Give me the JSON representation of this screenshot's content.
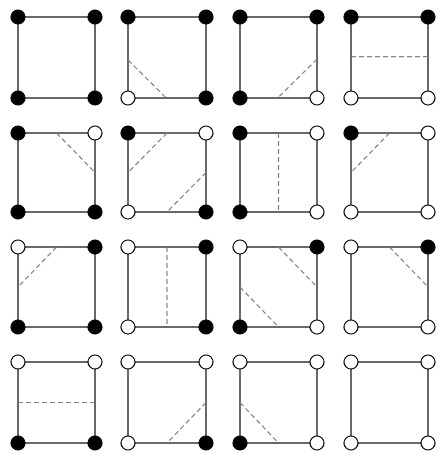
{
  "diagram": {
    "type": "marching-squares-cases",
    "colors": {
      "edge": "#2a2a2a",
      "filled": "#000000",
      "open_fill": "#ffffff",
      "dash": "#808080"
    },
    "columns_x": [
      [
        18,
        95
      ],
      [
        128,
        206
      ],
      [
        240,
        317
      ],
      [
        351,
        428
      ]
    ],
    "rows_y": [
      [
        17,
        98
      ],
      [
        133,
        212
      ],
      [
        247,
        327
      ],
      [
        362,
        443
      ]
    ],
    "vertex_radius": 7,
    "cells": [
      {
        "case": 1,
        "row": 0,
        "col": 0,
        "corners": {
          "tl": true,
          "tr": true,
          "bl": true,
          "br": true
        },
        "dashes": []
      },
      {
        "case": 2,
        "row": 0,
        "col": 1,
        "corners": {
          "tl": true,
          "tr": true,
          "bl": false,
          "br": true
        },
        "dashes": [
          [
            0,
            0.53,
            0.49,
            1
          ]
        ]
      },
      {
        "case": 3,
        "row": 0,
        "col": 2,
        "corners": {
          "tl": true,
          "tr": true,
          "bl": true,
          "br": false
        },
        "dashes": [
          [
            1,
            0.52,
            0.49,
            1
          ]
        ]
      },
      {
        "case": 4,
        "row": 0,
        "col": 3,
        "corners": {
          "tl": true,
          "tr": true,
          "bl": false,
          "br": false
        },
        "dashes": [
          [
            0,
            0.49,
            1,
            0.49
          ]
        ]
      },
      {
        "case": 5,
        "row": 1,
        "col": 0,
        "corners": {
          "tl": true,
          "tr": false,
          "bl": true,
          "br": true
        },
        "dashes": [
          [
            0.5,
            0,
            1,
            0.5
          ]
        ]
      },
      {
        "case": 6,
        "row": 1,
        "col": 1,
        "corners": {
          "tl": true,
          "tr": false,
          "bl": false,
          "br": true
        },
        "dashes": [
          [
            0.5,
            0,
            0,
            0.5
          ],
          [
            1,
            0.5,
            0.5,
            1
          ]
        ]
      },
      {
        "case": 7,
        "row": 1,
        "col": 2,
        "corners": {
          "tl": true,
          "tr": false,
          "bl": true,
          "br": false
        },
        "dashes": [
          [
            0.5,
            0,
            0.5,
            1
          ]
        ]
      },
      {
        "case": 8,
        "row": 1,
        "col": 3,
        "corners": {
          "tl": true,
          "tr": false,
          "bl": false,
          "br": false
        },
        "dashes": [
          [
            0.5,
            0,
            0,
            0.5
          ]
        ]
      },
      {
        "case": 9,
        "row": 2,
        "col": 0,
        "corners": {
          "tl": false,
          "tr": true,
          "bl": true,
          "br": true
        },
        "dashes": [
          [
            0.5,
            0,
            0,
            0.5
          ]
        ]
      },
      {
        "case": 10,
        "row": 2,
        "col": 1,
        "corners": {
          "tl": false,
          "tr": true,
          "bl": false,
          "br": true
        },
        "dashes": [
          [
            0.5,
            0,
            0.5,
            1
          ]
        ]
      },
      {
        "case": 11,
        "row": 2,
        "col": 2,
        "corners": {
          "tl": false,
          "tr": true,
          "bl": true,
          "br": false
        },
        "dashes": [
          [
            0.5,
            0,
            1,
            0.5
          ],
          [
            0,
            0.5,
            0.5,
            1
          ]
        ]
      },
      {
        "case": 12,
        "row": 2,
        "col": 3,
        "corners": {
          "tl": false,
          "tr": true,
          "bl": false,
          "br": false
        },
        "dashes": [
          [
            0.5,
            0,
            1,
            0.5
          ]
        ]
      },
      {
        "case": 13,
        "row": 3,
        "col": 0,
        "corners": {
          "tl": false,
          "tr": false,
          "bl": true,
          "br": true
        },
        "dashes": [
          [
            0,
            0.5,
            1,
            0.5
          ]
        ]
      },
      {
        "case": 14,
        "row": 3,
        "col": 1,
        "corners": {
          "tl": false,
          "tr": false,
          "bl": false,
          "br": true
        },
        "dashes": [
          [
            1,
            0.5,
            0.5,
            1
          ]
        ]
      },
      {
        "case": 15,
        "row": 3,
        "col": 2,
        "corners": {
          "tl": false,
          "tr": false,
          "bl": true,
          "br": false
        },
        "dashes": [
          [
            0,
            0.5,
            0.5,
            1
          ]
        ]
      },
      {
        "case": 16,
        "row": 3,
        "col": 3,
        "corners": {
          "tl": false,
          "tr": false,
          "bl": false,
          "br": false
        },
        "dashes": []
      }
    ]
  }
}
